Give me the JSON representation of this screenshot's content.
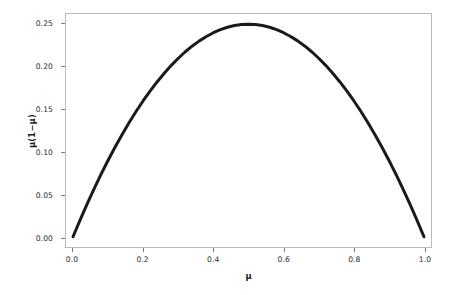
{
  "chart_data": {
    "type": "line",
    "title": "",
    "subtitle": "",
    "xlabel": "μ",
    "ylabel": "μ(1−μ)",
    "xlim": [
      -0.02,
      1.02
    ],
    "ylim": [
      -0.012,
      0.262
    ],
    "grid": false,
    "legend": null,
    "annotations": [],
    "line_color": "#1a1a1a",
    "line_width_px": 3,
    "frame_color": "#b9b9b9",
    "background_color": "#ffffff",
    "x_ticks": [
      0.0,
      0.2,
      0.4,
      0.6,
      0.8,
      1.0
    ],
    "x_tick_labels": [
      "0.0",
      "0.2",
      "0.4",
      "0.6",
      "0.8",
      "1.0"
    ],
    "y_ticks": [
      0.0,
      0.05,
      0.1,
      0.15,
      0.2,
      0.25
    ],
    "y_tick_labels": [
      "0.00",
      "0.05",
      "0.10",
      "0.15",
      "0.20",
      "0.25"
    ],
    "series": [
      {
        "name": "μ(1−μ)",
        "x": [
          0.0,
          0.02,
          0.04,
          0.06,
          0.08,
          0.1,
          0.12,
          0.14,
          0.16,
          0.18,
          0.2,
          0.22,
          0.24,
          0.26,
          0.28,
          0.3,
          0.32,
          0.34,
          0.36,
          0.38,
          0.4,
          0.42,
          0.44,
          0.46,
          0.48,
          0.5,
          0.52,
          0.54,
          0.56,
          0.58,
          0.6,
          0.62,
          0.64,
          0.66,
          0.68,
          0.7,
          0.72,
          0.74,
          0.76,
          0.78,
          0.8,
          0.82,
          0.84,
          0.86,
          0.88,
          0.9,
          0.92,
          0.94,
          0.96,
          0.98,
          1.0
        ],
        "y": [
          0.0,
          0.0196,
          0.0384,
          0.0564,
          0.0736,
          0.09,
          0.1056,
          0.1204,
          0.1344,
          0.1476,
          0.16,
          0.1716,
          0.1824,
          0.1924,
          0.2016,
          0.21,
          0.2176,
          0.2244,
          0.2304,
          0.2356,
          0.24,
          0.2436,
          0.2464,
          0.2484,
          0.2496,
          0.25,
          0.2496,
          0.2484,
          0.2464,
          0.2436,
          0.24,
          0.2356,
          0.2304,
          0.2244,
          0.2176,
          0.21,
          0.2016,
          0.1924,
          0.1824,
          0.1716,
          0.16,
          0.1476,
          0.1344,
          0.1204,
          0.1056,
          0.09,
          0.0736,
          0.0564,
          0.0384,
          0.0196,
          0.0
        ]
      }
    ],
    "peak": {
      "x": 0.5,
      "y": 0.25
    }
  }
}
